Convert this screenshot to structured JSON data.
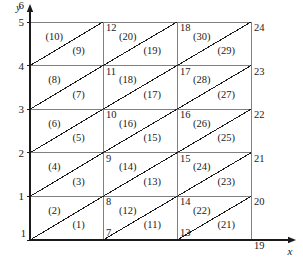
{
  "figure": {
    "type": "finite-element-mesh-diagram",
    "background_color": "#ffffff",
    "line_color": "#1a1a1a",
    "grid_color": "#808080"
  },
  "axes": {
    "x_label": "x",
    "y_label": "y",
    "x_ticks": [],
    "y_ticks": [
      "1",
      "2",
      "3",
      "4",
      "5",
      "6"
    ],
    "y_tick_values": [
      1,
      2,
      3,
      4,
      5,
      6
    ],
    "x_arrow": true,
    "y_arrow": true
  },
  "geometry": {
    "columns": 3,
    "rows": 5,
    "node_count": 24,
    "element_count": 30,
    "x_grid_px": [
      30,
      103,
      177,
      251
    ],
    "y_grid_px": [
      22,
      65.6,
      109.2,
      152.8,
      196.4,
      240
    ]
  },
  "nodes": [
    {
      "id": "1",
      "col": 0,
      "row": 0,
      "anchor": "right-below"
    },
    {
      "id": "7",
      "col": 1,
      "row": 0,
      "anchor": "left-below"
    },
    {
      "id": "8",
      "col": 1,
      "row": 1,
      "anchor": "left-below"
    },
    {
      "id": "9",
      "col": 1,
      "row": 2,
      "anchor": "left-below"
    },
    {
      "id": "10",
      "col": 1,
      "row": 3,
      "anchor": "left-below"
    },
    {
      "id": "11",
      "col": 1,
      "row": 4,
      "anchor": "left-below"
    },
    {
      "id": "12",
      "col": 1,
      "row": 5,
      "anchor": "left-below"
    },
    {
      "id": "13",
      "col": 2,
      "row": 0,
      "anchor": "left-below"
    },
    {
      "id": "14",
      "col": 2,
      "row": 1,
      "anchor": "left-below"
    },
    {
      "id": "15",
      "col": 2,
      "row": 2,
      "anchor": "left-below"
    },
    {
      "id": "16",
      "col": 2,
      "row": 3,
      "anchor": "left-below"
    },
    {
      "id": "17",
      "col": 2,
      "row": 4,
      "anchor": "left-below"
    },
    {
      "id": "18",
      "col": 2,
      "row": 5,
      "anchor": "left-below"
    },
    {
      "id": "19",
      "col": 3,
      "row": 0,
      "anchor": "right-below"
    },
    {
      "id": "20",
      "col": 3,
      "row": 1,
      "anchor": "right-below"
    },
    {
      "id": "21",
      "col": 3,
      "row": 2,
      "anchor": "right-below"
    },
    {
      "id": "22",
      "col": 3,
      "row": 3,
      "anchor": "right-below"
    },
    {
      "id": "23",
      "col": 3,
      "row": 4,
      "anchor": "right-below"
    },
    {
      "id": "24",
      "col": 3,
      "row": 5,
      "anchor": "right-below"
    }
  ],
  "elements": [
    {
      "label": "(1)",
      "col": 0,
      "row": 0,
      "half": "lower"
    },
    {
      "label": "(2)",
      "col": 0,
      "row": 0,
      "half": "upper"
    },
    {
      "label": "(3)",
      "col": 0,
      "row": 1,
      "half": "lower"
    },
    {
      "label": "(4)",
      "col": 0,
      "row": 1,
      "half": "upper"
    },
    {
      "label": "(5)",
      "col": 0,
      "row": 2,
      "half": "lower"
    },
    {
      "label": "(6)",
      "col": 0,
      "row": 2,
      "half": "upper"
    },
    {
      "label": "(7)",
      "col": 0,
      "row": 3,
      "half": "lower"
    },
    {
      "label": "(8)",
      "col": 0,
      "row": 3,
      "half": "upper"
    },
    {
      "label": "(9)",
      "col": 0,
      "row": 4,
      "half": "lower"
    },
    {
      "label": "(10)",
      "col": 0,
      "row": 4,
      "half": "upper"
    },
    {
      "label": "(11)",
      "col": 1,
      "row": 0,
      "half": "lower"
    },
    {
      "label": "(12)",
      "col": 1,
      "row": 0,
      "half": "upper"
    },
    {
      "label": "(13)",
      "col": 1,
      "row": 1,
      "half": "lower"
    },
    {
      "label": "(14)",
      "col": 1,
      "row": 1,
      "half": "upper"
    },
    {
      "label": "(15)",
      "col": 1,
      "row": 2,
      "half": "lower"
    },
    {
      "label": "(16)",
      "col": 1,
      "row": 2,
      "half": "upper"
    },
    {
      "label": "(17)",
      "col": 1,
      "row": 3,
      "half": "lower"
    },
    {
      "label": "(18)",
      "col": 1,
      "row": 3,
      "half": "upper"
    },
    {
      "label": "(19)",
      "col": 1,
      "row": 4,
      "half": "lower"
    },
    {
      "label": "(20)",
      "col": 1,
      "row": 4,
      "half": "upper"
    },
    {
      "label": "(21)",
      "col": 2,
      "row": 0,
      "half": "lower"
    },
    {
      "label": "(22)",
      "col": 2,
      "row": 0,
      "half": "upper"
    },
    {
      "label": "(23)",
      "col": 2,
      "row": 1,
      "half": "lower"
    },
    {
      "label": "(24)",
      "col": 2,
      "row": 1,
      "half": "upper"
    },
    {
      "label": "(25)",
      "col": 2,
      "row": 2,
      "half": "lower"
    },
    {
      "label": "(26)",
      "col": 2,
      "row": 2,
      "half": "upper"
    },
    {
      "label": "(27)",
      "col": 2,
      "row": 3,
      "half": "lower"
    },
    {
      "label": "(28)",
      "col": 2,
      "row": 3,
      "half": "upper"
    },
    {
      "label": "(29)",
      "col": 2,
      "row": 4,
      "half": "lower"
    },
    {
      "label": "(30)",
      "col": 2,
      "row": 4,
      "half": "upper"
    }
  ]
}
